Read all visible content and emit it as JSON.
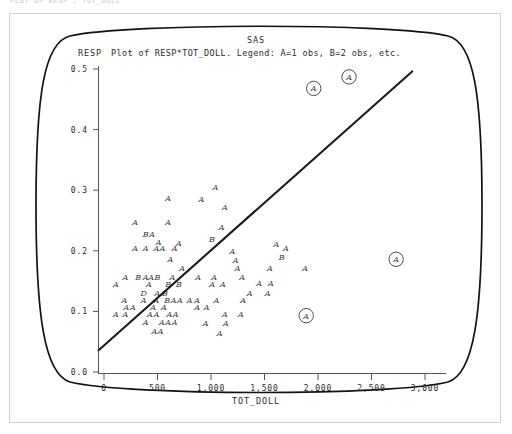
{
  "window": {
    "clipped_header_text": "PLOT OF RESP ; TOT_DOLL"
  },
  "header": {
    "system_title": "SAS",
    "plot_title": "Plot of RESP*TOT_DOLL. Legend: A=1 obs, B=2 obs, etc."
  },
  "axes": {
    "y_label": "RESP",
    "x_label": "TOT_DOLL",
    "y_ticks": [
      "0.5",
      "0.4",
      "0.3",
      "0.2",
      "0.1",
      "0.0"
    ],
    "x_ticks": [
      "0",
      "500",
      "1,000",
      "1,500",
      "2,000",
      "2,500",
      "3,000"
    ]
  },
  "colors": {
    "frame": "#121212",
    "axis": "#555555",
    "text": "#2b2b2b",
    "point": "#3a3a3a",
    "regression": "#1a1a1a",
    "outer_border": "#d2d2d2",
    "background": "#ffffff"
  },
  "chart_data": {
    "type": "scatter",
    "title": "Plot of RESP*TOT_DOLL. Legend: A=1 obs, B=2 obs, etc.",
    "subtitle": "SAS",
    "xlabel": "TOT_DOLL",
    "ylabel": "RESP",
    "xlim": [
      0,
      3000
    ],
    "ylim": [
      0.0,
      0.5
    ],
    "xticks": [
      0,
      500,
      1000,
      1500,
      2000,
      2500,
      3000
    ],
    "yticks": [
      0.0,
      0.1,
      0.2,
      0.3,
      0.4,
      0.5
    ],
    "grid": false,
    "legend": "A=1 obs, B=2 obs, etc.",
    "legend_position": "title",
    "regression_line": {
      "x": [
        -50,
        2880
      ],
      "y": [
        0.036,
        0.496
      ],
      "slope": 0.000157,
      "intercept": 0.0439
    },
    "points": [
      {
        "label": "A",
        "x": 600,
        "y": 0.287
      },
      {
        "label": "A",
        "x": 910,
        "y": 0.285
      },
      {
        "label": "A",
        "x": 1130,
        "y": 0.272
      },
      {
        "label": "A",
        "x": 1040,
        "y": 0.305
      },
      {
        "label": "A",
        "x": 290,
        "y": 0.248
      },
      {
        "label": "A",
        "x": 600,
        "y": 0.248
      },
      {
        "label": "A",
        "x": 1100,
        "y": 0.239
      },
      {
        "label": "B",
        "x": 390,
        "y": 0.227
      },
      {
        "label": "A",
        "x": 450,
        "y": 0.227
      },
      {
        "label": "A",
        "x": 510,
        "y": 0.215
      },
      {
        "label": "A",
        "x": 700,
        "y": 0.213
      },
      {
        "label": "B",
        "x": 1010,
        "y": 0.219
      },
      {
        "label": "A",
        "x": 290,
        "y": 0.204
      },
      {
        "label": "A",
        "x": 390,
        "y": 0.204
      },
      {
        "label": "A",
        "x": 490,
        "y": 0.204
      },
      {
        "label": "A",
        "x": 545,
        "y": 0.204
      },
      {
        "label": "A",
        "x": 660,
        "y": 0.204
      },
      {
        "label": "A",
        "x": 1200,
        "y": 0.199
      },
      {
        "label": "A",
        "x": 620,
        "y": 0.187
      },
      {
        "label": "A",
        "x": 1230,
        "y": 0.184
      },
      {
        "label": "A",
        "x": 730,
        "y": 0.172
      },
      {
        "label": "A",
        "x": 1250,
        "y": 0.172
      },
      {
        "label": "A",
        "x": 1610,
        "y": 0.212
      },
      {
        "label": "A",
        "x": 1700,
        "y": 0.205
      },
      {
        "label": "B",
        "x": 1660,
        "y": 0.189
      },
      {
        "label": "A",
        "x": 1550,
        "y": 0.172
      },
      {
        "label": "A",
        "x": 1880,
        "y": 0.172
      },
      {
        "label": "A",
        "x": 200,
        "y": 0.157
      },
      {
        "label": "B",
        "x": 320,
        "y": 0.157
      },
      {
        "label": "A",
        "x": 390,
        "y": 0.157
      },
      {
        "label": "A",
        "x": 440,
        "y": 0.157
      },
      {
        "label": "B",
        "x": 500,
        "y": 0.157
      },
      {
        "label": "A",
        "x": 640,
        "y": 0.157
      },
      {
        "label": "A",
        "x": 880,
        "y": 0.157
      },
      {
        "label": "A",
        "x": 1030,
        "y": 0.157
      },
      {
        "label": "A",
        "x": 1290,
        "y": 0.157
      },
      {
        "label": "A",
        "x": 110,
        "y": 0.145
      },
      {
        "label": "A",
        "x": 420,
        "y": 0.145
      },
      {
        "label": "B",
        "x": 600,
        "y": 0.145
      },
      {
        "label": "B",
        "x": 700,
        "y": 0.145
      },
      {
        "label": "A",
        "x": 1010,
        "y": 0.145
      },
      {
        "label": "A",
        "x": 1110,
        "y": 0.145
      },
      {
        "label": "A",
        "x": 1450,
        "y": 0.147
      },
      {
        "label": "A",
        "x": 1560,
        "y": 0.147
      },
      {
        "label": "D",
        "x": 370,
        "y": 0.131
      },
      {
        "label": "A",
        "x": 500,
        "y": 0.131
      },
      {
        "label": "B",
        "x": 570,
        "y": 0.131
      },
      {
        "label": "A",
        "x": 1360,
        "y": 0.131
      },
      {
        "label": "A",
        "x": 1530,
        "y": 0.131
      },
      {
        "label": "A",
        "x": 190,
        "y": 0.118
      },
      {
        "label": "A",
        "x": 370,
        "y": 0.118
      },
      {
        "label": "A",
        "x": 490,
        "y": 0.118
      },
      {
        "label": "B",
        "x": 590,
        "y": 0.118
      },
      {
        "label": "A",
        "x": 650,
        "y": 0.118
      },
      {
        "label": "A",
        "x": 710,
        "y": 0.118
      },
      {
        "label": "A",
        "x": 800,
        "y": 0.118
      },
      {
        "label": "A",
        "x": 870,
        "y": 0.118
      },
      {
        "label": "A",
        "x": 1050,
        "y": 0.118
      },
      {
        "label": "A",
        "x": 1300,
        "y": 0.118
      },
      {
        "label": "A",
        "x": 210,
        "y": 0.107
      },
      {
        "label": "A",
        "x": 270,
        "y": 0.107
      },
      {
        "label": "A",
        "x": 460,
        "y": 0.107
      },
      {
        "label": "A",
        "x": 560,
        "y": 0.107
      },
      {
        "label": "A",
        "x": 870,
        "y": 0.107
      },
      {
        "label": "A",
        "x": 960,
        "y": 0.107
      },
      {
        "label": "A",
        "x": 110,
        "y": 0.095
      },
      {
        "label": "A",
        "x": 200,
        "y": 0.095
      },
      {
        "label": "A",
        "x": 430,
        "y": 0.095
      },
      {
        "label": "A",
        "x": 490,
        "y": 0.095
      },
      {
        "label": "A",
        "x": 610,
        "y": 0.095
      },
      {
        "label": "A",
        "x": 670,
        "y": 0.095
      },
      {
        "label": "A",
        "x": 1130,
        "y": 0.096
      },
      {
        "label": "A",
        "x": 1280,
        "y": 0.096
      },
      {
        "label": "A",
        "x": 390,
        "y": 0.083
      },
      {
        "label": "A",
        "x": 540,
        "y": 0.083
      },
      {
        "label": "A",
        "x": 600,
        "y": 0.083
      },
      {
        "label": "A",
        "x": 660,
        "y": 0.083
      },
      {
        "label": "A",
        "x": 950,
        "y": 0.081
      },
      {
        "label": "A",
        "x": 1140,
        "y": 0.081
      },
      {
        "label": "A",
        "x": 470,
        "y": 0.068
      },
      {
        "label": "A",
        "x": 530,
        "y": 0.068
      },
      {
        "label": "A",
        "x": 1080,
        "y": 0.065
      }
    ],
    "highlighted_points": [
      {
        "label": "A",
        "x": 1960,
        "y": 0.468,
        "marker": "circled"
      },
      {
        "label": "A",
        "x": 2290,
        "y": 0.487,
        "marker": "circled"
      },
      {
        "label": "A",
        "x": 2730,
        "y": 0.186,
        "marker": "circled"
      },
      {
        "label": "A",
        "x": 1890,
        "y": 0.093,
        "marker": "circled"
      }
    ]
  }
}
